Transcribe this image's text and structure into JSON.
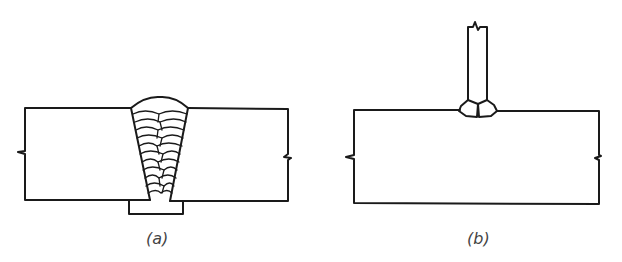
{
  "figure": {
    "panels": [
      {
        "id": "a",
        "label": "(a)",
        "description": "Butt joint with V-groove multi-pass weld and backing bar"
      },
      {
        "id": "b",
        "label": "(b)",
        "description": "Tee joint with double fillet welds"
      }
    ],
    "colors": {
      "line": "#1a1a1a",
      "background": "#ffffff"
    }
  }
}
